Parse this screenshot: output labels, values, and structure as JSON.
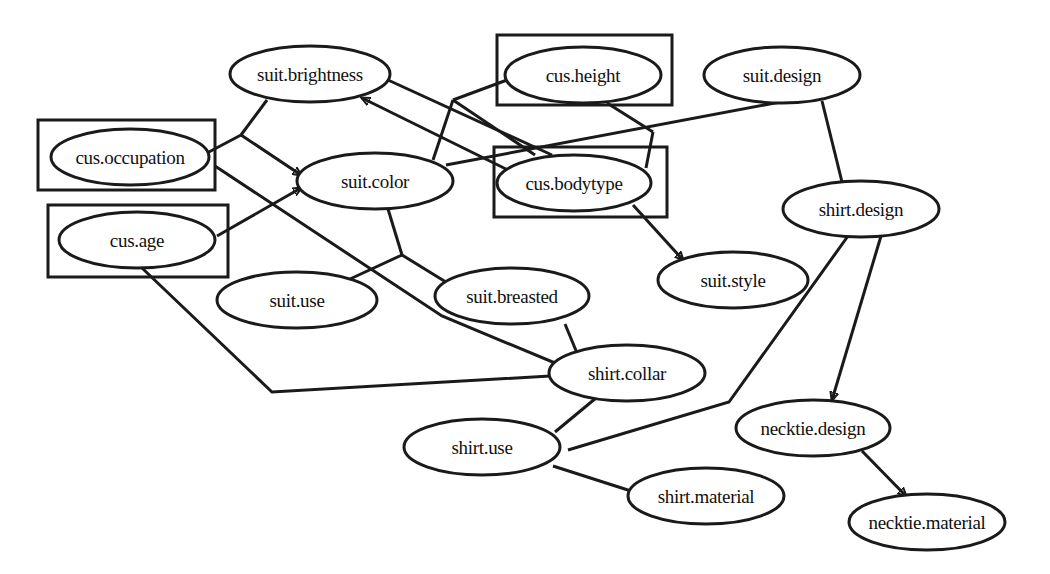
{
  "diagram": {
    "type": "bayesian-network",
    "colors": {
      "stroke": "#1a1a1a",
      "text": "#111111",
      "background": "#ffffff"
    },
    "nodes": [
      {
        "id": "suit_brightness",
        "label": "suit.brightness",
        "cx": 310,
        "cy": 74,
        "rx": 80,
        "ry": 28,
        "boxed": false
      },
      {
        "id": "cus_height",
        "label": "cus.height",
        "cx": 583,
        "cy": 75,
        "rx": 78,
        "ry": 28,
        "boxed": true,
        "box": [
          497,
          35,
          175,
          70
        ]
      },
      {
        "id": "suit_design",
        "label": "suit.design",
        "cx": 782,
        "cy": 75,
        "rx": 78,
        "ry": 28,
        "boxed": false
      },
      {
        "id": "cus_occupation",
        "label": "cus.occupation",
        "cx": 130,
        "cy": 157,
        "rx": 79,
        "ry": 28,
        "boxed": true,
        "box": [
          38,
          120,
          177,
          70
        ]
      },
      {
        "id": "suit_color",
        "label": "suit.color",
        "cx": 375,
        "cy": 181,
        "rx": 78,
        "ry": 28,
        "boxed": false
      },
      {
        "id": "cus_bodytype",
        "label": "cus.bodytype",
        "cx": 574,
        "cy": 183,
        "rx": 77,
        "ry": 28,
        "boxed": true,
        "box": [
          494,
          147,
          173,
          70
        ]
      },
      {
        "id": "shirt_design",
        "label": "shirt.design",
        "cx": 861,
        "cy": 209,
        "rx": 78,
        "ry": 28,
        "boxed": false
      },
      {
        "id": "cus_age",
        "label": "cus.age",
        "cx": 137,
        "cy": 240,
        "rx": 78,
        "ry": 28,
        "boxed": true,
        "box": [
          48,
          205,
          180,
          72
        ]
      },
      {
        "id": "suit_style",
        "label": "suit.style",
        "cx": 733,
        "cy": 280,
        "rx": 75,
        "ry": 28,
        "boxed": false
      },
      {
        "id": "suit_use",
        "label": "suit.use",
        "cx": 297,
        "cy": 300,
        "rx": 80,
        "ry": 28,
        "boxed": false
      },
      {
        "id": "suit_breasted",
        "label": "suit.breasted",
        "cx": 512,
        "cy": 296,
        "rx": 77,
        "ry": 28,
        "boxed": false
      },
      {
        "id": "shirt_collar",
        "label": "shirt.collar",
        "cx": 627,
        "cy": 373,
        "rx": 78,
        "ry": 28,
        "boxed": false
      },
      {
        "id": "necktie_design",
        "label": "necktie.design",
        "cx": 813,
        "cy": 428,
        "rx": 77,
        "ry": 28,
        "boxed": false
      },
      {
        "id": "shirt_use",
        "label": "shirt.use",
        "cx": 482,
        "cy": 447,
        "rx": 78,
        "ry": 28,
        "boxed": false
      },
      {
        "id": "shirt_material",
        "label": "shirt.material",
        "cx": 706,
        "cy": 496,
        "rx": 78,
        "ry": 28,
        "boxed": false
      },
      {
        "id": "necktie_material",
        "label": "necktie.material",
        "cx": 927,
        "cy": 522,
        "rx": 78,
        "ry": 28,
        "boxed": false
      }
    ],
    "edges": [
      {
        "id": "brightness_occupation_junction",
        "from": "suit_brightness",
        "to": "junction_a",
        "directed": false,
        "points": [
          [
            267,
            100
          ],
          [
            241,
            135
          ]
        ]
      },
      {
        "id": "occupation_junction",
        "from": "cus_occupation",
        "to": "junction_a",
        "directed": false,
        "points": [
          [
            207,
            153
          ],
          [
            241,
            135
          ]
        ]
      },
      {
        "id": "junction_a_to_suit_color",
        "from": "junction_a",
        "to": "suit_color",
        "directed": true,
        "points": [
          [
            241,
            135
          ],
          [
            301,
            175
          ]
        ]
      },
      {
        "id": "age_to_suit_color",
        "from": "cus_age",
        "to": "suit_color",
        "directed": true,
        "points": [
          [
            217,
            236
          ],
          [
            301,
            188
          ]
        ]
      },
      {
        "id": "bodytype_to_brightness",
        "from": "cus_bodytype",
        "to": "suit_brightness",
        "directed": true,
        "points": [
          [
            508,
            170
          ],
          [
            362,
            98
          ]
        ]
      },
      {
        "id": "brightness_to_bodytype_line",
        "from": "suit_brightness",
        "to": "cus_bodytype",
        "directed": false,
        "points": [
          [
            388,
            80
          ],
          [
            552,
            155
          ]
        ]
      },
      {
        "id": "color_height_junction",
        "from": "suit_color",
        "to": "junction_b",
        "directed": false,
        "points": [
          [
            433,
            160
          ],
          [
            453,
            100
          ]
        ]
      },
      {
        "id": "height_junction",
        "from": "cus_height",
        "to": "junction_b",
        "directed": false,
        "points": [
          [
            507,
            80
          ],
          [
            453,
            100
          ]
        ]
      },
      {
        "id": "junction_b_to_bodytype",
        "from": "junction_b",
        "to": "cus_bodytype",
        "directed": false,
        "points": [
          [
            453,
            100
          ],
          [
            535,
            155
          ]
        ]
      },
      {
        "id": "color_to_suit_design",
        "from": "suit_color",
        "to": "suit_design",
        "directed": false,
        "points": [
          [
            446,
            165
          ],
          [
            780,
            102
          ]
        ]
      },
      {
        "id": "height_to_bodytype_junction",
        "from": "cus_height",
        "to": "junction_c",
        "directed": false,
        "points": [
          [
            607,
            103
          ],
          [
            653,
            132
          ]
        ]
      },
      {
        "id": "junction_c_to_bodytype",
        "from": "junction_c",
        "to": "cus_bodytype",
        "directed": false,
        "points": [
          [
            653,
            132
          ],
          [
            646,
            168
          ]
        ]
      },
      {
        "id": "bodytype_to_suit_style",
        "from": "cus_bodytype",
        "to": "suit_style",
        "directed": true,
        "points": [
          [
            633,
            205
          ],
          [
            683,
            260
          ]
        ]
      },
      {
        "id": "suit_design_to_shirt_design",
        "from": "suit_design",
        "to": "shirt_design",
        "directed": false,
        "points": [
          [
            822,
            101
          ],
          [
            842,
            182
          ]
        ]
      },
      {
        "id": "shirt_design_to_necktie_design",
        "from": "shirt_design",
        "to": "necktie_design",
        "directed": true,
        "points": [
          [
            881,
            236
          ],
          [
            832,
            400
          ]
        ]
      },
      {
        "id": "shirt_design_to_shirt_use",
        "from": "shirt_design",
        "to": "shirt_use",
        "directed": false,
        "points": [
          [
            848,
            236
          ],
          [
            729,
            402
          ],
          [
            568,
            450
          ]
        ]
      },
      {
        "id": "necktie_design_to_material",
        "from": "necktie_design",
        "to": "necktie_material",
        "directed": true,
        "points": [
          [
            862,
            451
          ],
          [
            906,
            496
          ]
        ]
      },
      {
        "id": "color_to_junction_d",
        "from": "suit_color",
        "to": "junction_d",
        "directed": false,
        "points": [
          [
            388,
            209
          ],
          [
            402,
            255
          ]
        ]
      },
      {
        "id": "suit_use_to_junction_d",
        "from": "suit_use",
        "to": "junction_d",
        "directed": false,
        "points": [
          [
            350,
            279
          ],
          [
            402,
            255
          ]
        ]
      },
      {
        "id": "junction_d_to_breasted",
        "from": "junction_d",
        "to": "suit_breasted",
        "directed": false,
        "points": [
          [
            402,
            255
          ],
          [
            454,
            287
          ]
        ]
      },
      {
        "id": "occupation_to_shirt_collar",
        "from": "cus_occupation",
        "to": "shirt_collar",
        "directed": false,
        "points": [
          [
            215,
            166
          ],
          [
            442,
            316
          ],
          [
            567,
            368
          ]
        ]
      },
      {
        "id": "age_to_shirt_collar",
        "from": "cus_age",
        "to": "shirt_collar",
        "directed": false,
        "points": [
          [
            142,
            268
          ],
          [
            272,
            392
          ],
          [
            567,
            375
          ]
        ]
      },
      {
        "id": "breasted_to_shirt_collar",
        "from": "suit_breasted",
        "to": "shirt_collar",
        "directed": false,
        "points": [
          [
            565,
            324
          ],
          [
            577,
            353
          ]
        ]
      },
      {
        "id": "collar_to_shirt_use",
        "from": "shirt_collar",
        "to": "shirt_use",
        "directed": false,
        "points": [
          [
            596,
            398
          ],
          [
            555,
            432
          ]
        ]
      },
      {
        "id": "shirt_use_to_material",
        "from": "shirt_use",
        "to": "shirt_material",
        "directed": false,
        "points": [
          [
            553,
            466
          ],
          [
            631,
            491
          ]
        ]
      }
    ]
  }
}
